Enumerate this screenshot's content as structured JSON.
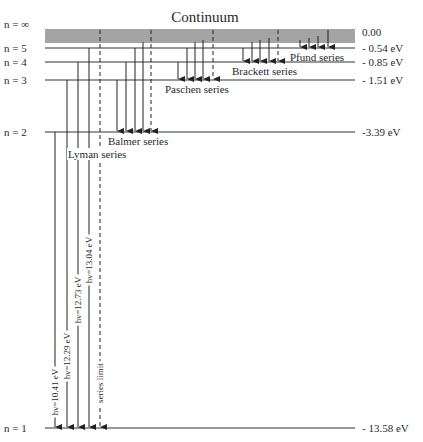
{
  "title": "Continuum",
  "levels": [
    {
      "n_label": "n = ∞",
      "energy_label": "0.00",
      "y": 33
    },
    {
      "n_label": "n = 5",
      "energy_label": "- 0.54 eV",
      "y": 48
    },
    {
      "n_label": "n = 4",
      "energy_label": "- 0.85 eV",
      "y": 62
    },
    {
      "n_label": "n = 3",
      "energy_label": "- 1.51 eV",
      "y": 80
    },
    {
      "n_label": "n = 2",
      "energy_label": "-3.39 eV",
      "y": 132
    },
    {
      "n_label": "n = 1",
      "energy_label": "- 13.58 eV",
      "y": 428
    }
  ],
  "continuum_lines_y": [
    30,
    32,
    34,
    36,
    38,
    40,
    42
  ],
  "series": [
    {
      "name": "Lyman series",
      "label_pos": [
        68,
        158
      ],
      "to_y": 428,
      "arrows": [
        {
          "x": 55,
          "from_y": 132,
          "dashed": false,
          "label": "hν=10.41 eV",
          "label_cy": 392
        },
        {
          "x": 67,
          "from_y": 80,
          "dashed": false,
          "label": "hν=12.29 eV",
          "label_cy": 356
        },
        {
          "x": 78,
          "from_y": 62,
          "dashed": false,
          "label": "hν=12.73 eV",
          "label_cy": 300
        },
        {
          "x": 89,
          "from_y": 48,
          "dashed": false,
          "label": "hν=13.04 eV",
          "label_cy": 260
        },
        {
          "x": 100,
          "from_y": 30,
          "dashed": true,
          "label": "series limit",
          "label_cy": 383
        }
      ]
    },
    {
      "name": "Balmer series",
      "label_pos": [
        108,
        145
      ],
      "to_y": 132,
      "arrows": [
        {
          "x": 117,
          "from_y": 80,
          "dashed": false
        },
        {
          "x": 126,
          "from_y": 62,
          "dashed": false
        },
        {
          "x": 135,
          "from_y": 48,
          "dashed": false
        },
        {
          "x": 143,
          "from_y": 42,
          "dashed": false
        },
        {
          "x": 151,
          "from_y": 30,
          "dashed": true
        }
      ]
    },
    {
      "name": "Paschen series",
      "label_pos": [
        165,
        93
      ],
      "to_y": 80,
      "arrows": [
        {
          "x": 178,
          "from_y": 62,
          "dashed": false
        },
        {
          "x": 187,
          "from_y": 48,
          "dashed": false
        },
        {
          "x": 195,
          "from_y": 42,
          "dashed": false
        },
        {
          "x": 203,
          "from_y": 40,
          "dashed": false
        },
        {
          "x": 213,
          "from_y": 30,
          "dashed": true
        }
      ]
    },
    {
      "name": "Brackett series",
      "label_pos": [
        232,
        75
      ],
      "to_y": 62,
      "arrows": [
        {
          "x": 243,
          "from_y": 48,
          "dashed": false
        },
        {
          "x": 252,
          "from_y": 42,
          "dashed": false
        },
        {
          "x": 260,
          "from_y": 40,
          "dashed": false
        },
        {
          "x": 269,
          "from_y": 38,
          "dashed": false
        },
        {
          "x": 278,
          "from_y": 30,
          "dashed": true
        }
      ]
    },
    {
      "name": "Pfund series",
      "label_pos": [
        290,
        61
      ],
      "to_y": 48,
      "arrows": [
        {
          "x": 300,
          "from_y": 40,
          "dashed": false
        },
        {
          "x": 309,
          "from_y": 38,
          "dashed": false
        },
        {
          "x": 318,
          "from_y": 36,
          "dashed": false
        },
        {
          "x": 328,
          "from_y": 30,
          "dashed": false
        }
      ]
    }
  ],
  "layout": {
    "line_x1": 45,
    "line_x2": 355,
    "n_label_x": 4,
    "energy_label_x": 362,
    "title_x": 205,
    "title_y": 22,
    "line_color": "#333333"
  }
}
